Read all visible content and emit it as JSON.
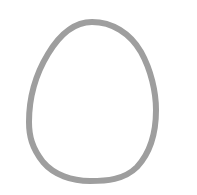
{
  "canvas": {
    "width": 197,
    "height": 195,
    "background_color": "#ffffff",
    "title": "Egg Outline Sketch"
  },
  "drawing": {
    "name": "egg-outline",
    "description": "Hand-drawn closed egg-shaped oval outline",
    "stroke_color": "#9e9e9e",
    "stroke_width": 6,
    "fill": "none",
    "bounds": {
      "left": 29,
      "right": 156,
      "top": 22,
      "bottom": 181,
      "width": 127,
      "height": 159
    },
    "apex": {
      "x": 92,
      "y": 22
    },
    "base": {
      "x": 90,
      "y": 181
    },
    "widest_point_y": 122,
    "path": "M 92 22 C 112 22 130 33 141 52 C 151 70 156 92 156 110 C 156 133 150 153 137 167 C 124 180 106 181 90 181 C 72 181 54 175 43 162 C 32 148 29 136 29 122 C 29 101 34 77 48 54 C 60 34 74 22 92 22 Z"
  }
}
